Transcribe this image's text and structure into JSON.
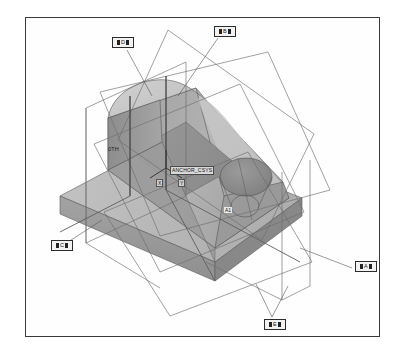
{
  "view": {
    "title": "3D Solid Model View",
    "background_color": "#ffffff",
    "frame_color": "#3a3a3a"
  },
  "model": {
    "description": "Shaded isometric solid part with rounded top block, base slab and countersunk hole",
    "shading": {
      "top_light": "#c9c9c9",
      "top_mid": "#b4b4b4",
      "front_face": "#a6a6a6",
      "side_dark": "#8e8e8e",
      "base_light": "#bdbdbd",
      "base_shadow": "#9a9a9a",
      "hole_dark": "#8a8a8a",
      "edge_color": "#4f4f4f"
    },
    "wireframe_color": "#6b6b6b"
  },
  "datums": [
    {
      "id": "datum-d",
      "label": "D",
      "x": 112,
      "y": 37
    },
    {
      "id": "datum-b",
      "label": "B",
      "x": 214,
      "y": 26
    },
    {
      "id": "datum-c",
      "label": "C",
      "x": 51,
      "y": 240
    },
    {
      "id": "datum-a",
      "label": "A",
      "x": 355,
      "y": 261
    },
    {
      "id": "datum-e",
      "label": "E",
      "x": 264,
      "y": 319
    }
  ],
  "annotations": {
    "csys_name": "ANCHOR_CSYS",
    "csys_x": 170,
    "csys_y": 166,
    "axis_x_label": "X",
    "axis_y_label": "Y",
    "axis_z_label": "Z",
    "feature_label": "0TH",
    "feature_x": 108,
    "feature_y": 146,
    "hole_label": "A1",
    "hole_x": 224,
    "hole_y": 207
  }
}
